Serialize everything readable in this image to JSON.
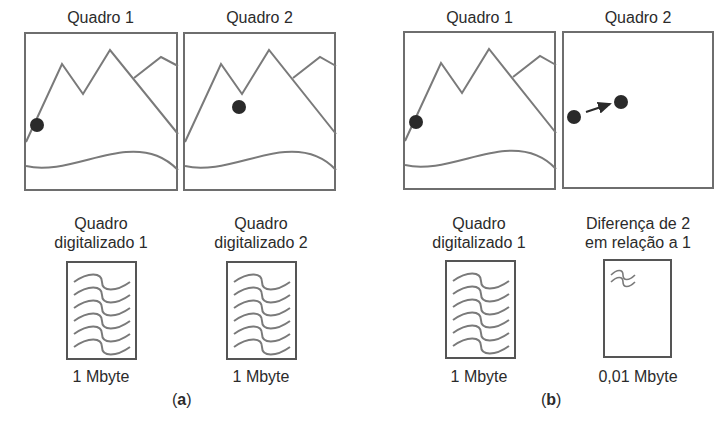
{
  "panel_a": {
    "caption_open": "(",
    "caption_letter": "a",
    "caption_close": ")",
    "frame1_title": "Quadro 1",
    "frame2_title": "Quadro 2",
    "doc1_title_line1": "Quadro",
    "doc1_title_line2": "digitalizado 1",
    "doc2_title_line1": "Quadro",
    "doc2_title_line2": "digitalizado 2",
    "doc1_size": "1 Mbyte",
    "doc2_size": "1 Mbyte"
  },
  "panel_b": {
    "caption_open": "(",
    "caption_letter": "b",
    "caption_close": ")",
    "frame1_title": "Quadro 1",
    "frame2_title": "Quadro 2",
    "doc1_title_line1": "Quadro",
    "doc1_title_line2": "digitalizado 1",
    "doc2_title_line1": "Diferença de 2",
    "doc2_title_line2": "em relação a 1",
    "doc1_size": "1 Mbyte",
    "doc2_size": "0,01 Mbyte"
  },
  "colors": {
    "line": "#7a7a7a",
    "border": "#6e6e6e",
    "ball": "#2a2a2a",
    "text": "#2b2b2b"
  }
}
